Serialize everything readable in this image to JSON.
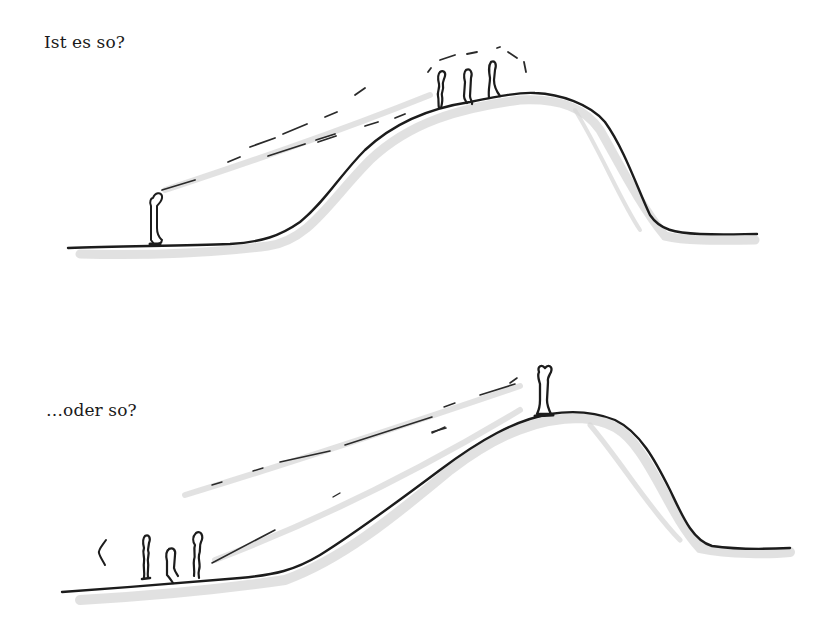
{
  "illustration": {
    "style": "hand-drawn pencil and ink sketch",
    "colors": {
      "ink": "#1c1c1c",
      "shading": "#c9c9c9",
      "background": "#ffffff"
    },
    "panels": [
      {
        "caption": "Ist es so?",
        "description": "One person at the foot of a hill looks up at a group of three people standing near the summit",
        "figures": [
          {
            "role": "lone-figure",
            "position": "foot of hill"
          },
          {
            "role": "group-figure-1",
            "position": "hilltop"
          },
          {
            "role": "group-figure-2",
            "position": "hilltop"
          },
          {
            "role": "group-figure-3",
            "position": "hilltop"
          }
        ]
      },
      {
        "caption": "…oder so?",
        "description": "A group of three people at the foot of a hill look up at one person standing alone on the summit",
        "figures": [
          {
            "role": "group-figure-1",
            "position": "foot of hill"
          },
          {
            "role": "group-figure-2",
            "position": "foot of hill"
          },
          {
            "role": "group-figure-3",
            "position": "foot of hill"
          },
          {
            "role": "lone-figure",
            "position": "summit"
          }
        ]
      }
    ]
  }
}
